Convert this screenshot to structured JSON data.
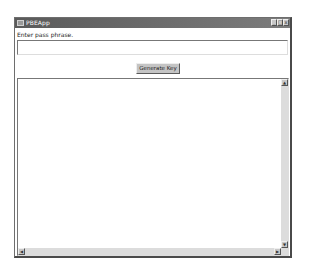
{
  "window": {
    "title": "PBEApp",
    "controls": {
      "minimize": "_",
      "maximize": "□",
      "close": "x"
    }
  },
  "form": {
    "label": "Enter pass phrase.",
    "passphrase_value": "",
    "generate_button": "Generate Key"
  },
  "output": {
    "text": "",
    "scroll_up": "▲",
    "scroll_down": "▼",
    "scroll_left": "◀",
    "scroll_right": "▶"
  },
  "colors": {
    "titlebar": "#6a6a6a",
    "button_face": "#c4c4c4",
    "scroll_track": "#dcdcdc"
  }
}
